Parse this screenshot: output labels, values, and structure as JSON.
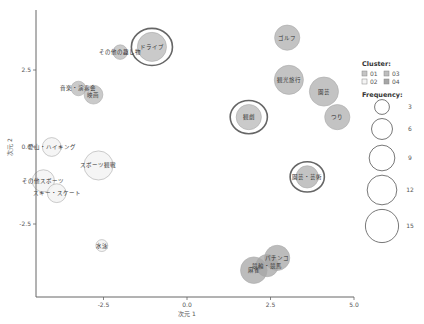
{
  "chart_data": {
    "type": "scatter",
    "subtype": "bubble",
    "title": "",
    "xlabel": "次元 1",
    "ylabel": "次元 2",
    "xlim": [
      -4.5,
      5.0
    ],
    "ylim": [
      -4.7,
      3.8
    ],
    "xticks": [
      -2.5,
      0.0,
      2.5,
      5.0
    ],
    "yticks": [
      -2.5,
      0.0,
      2.5
    ],
    "xtick_labels": [
      "-2.5",
      "0.0",
      "2.5",
      "5.0"
    ],
    "ytick_labels": [
      "-2.5",
      "0.0",
      "2.5"
    ],
    "grid": false,
    "legend_position": "right",
    "cluster_colors": {
      "01": "#c4c4c4",
      "02": "#f4f4f4",
      "03": "#bdbdbd",
      "04": "#a6a6a6"
    },
    "points": [
      {
        "label": "ドライブ",
        "x": -1.05,
        "y": 3.25,
        "frequency": 12,
        "cluster": "01",
        "highlighted": true
      },
      {
        "label": "その他の趣し物",
        "x": -2.0,
        "y": 3.08,
        "frequency": 3,
        "cluster": "01",
        "highlighted": false
      },
      {
        "label": "音楽・演奏会",
        "x": -3.25,
        "y": 1.9,
        "frequency": 3,
        "cluster": "01",
        "highlighted": false
      },
      {
        "label": "映画",
        "x": -2.8,
        "y": 1.7,
        "frequency": 5,
        "cluster": "01",
        "highlighted": false
      },
      {
        "label": "ゴルフ",
        "x": 3.0,
        "y": 3.55,
        "frequency": 9,
        "cluster": "03",
        "highlighted": false
      },
      {
        "label": "観光旅行",
        "x": 3.05,
        "y": 2.18,
        "frequency": 12,
        "cluster": "03",
        "highlighted": false
      },
      {
        "label": "園芸",
        "x": 4.1,
        "y": 1.8,
        "frequency": 12,
        "cluster": "03",
        "highlighted": false
      },
      {
        "label": "つり",
        "x": 4.5,
        "y": 0.97,
        "frequency": 9,
        "cluster": "03",
        "highlighted": false
      },
      {
        "label": "観劇",
        "x": 1.85,
        "y": 0.97,
        "frequency": 9,
        "cluster": "01",
        "highlighted": true
      },
      {
        "label": "園芸・芸術",
        "x": 3.6,
        "y": -0.97,
        "frequency": 7,
        "cluster": "03",
        "highlighted": true
      },
      {
        "label": "登山・ハイキング",
        "x": -4.05,
        "y": 0.0,
        "frequency": 5,
        "cluster": "02",
        "highlighted": false
      },
      {
        "label": "スポーツ観戦",
        "x": -2.65,
        "y": -0.6,
        "frequency": 12,
        "cluster": "02",
        "highlighted": false
      },
      {
        "label": "その他スポーツ",
        "x": -4.3,
        "y": -1.1,
        "frequency": 7,
        "cluster": "02",
        "highlighted": false
      },
      {
        "label": "スキー・スケート",
        "x": -3.9,
        "y": -1.5,
        "frequency": 5,
        "cluster": "02",
        "highlighted": false
      },
      {
        "label": "水泳",
        "x": -2.55,
        "y": -3.2,
        "frequency": 2,
        "cluster": "02",
        "highlighted": false
      },
      {
        "label": "パチンコ",
        "x": 2.7,
        "y": -3.6,
        "frequency": 9,
        "cluster": "04",
        "highlighted": false
      },
      {
        "label": "競輪・競馬",
        "x": 2.4,
        "y": -3.85,
        "frequency": 7,
        "cluster": "04",
        "highlighted": false
      },
      {
        "label": "麻雀",
        "x": 2.0,
        "y": -4.0,
        "frequency": 10,
        "cluster": "04",
        "highlighted": false
      }
    ],
    "legend": {
      "cluster_title": "Cluster:",
      "clusters": [
        "01",
        "02",
        "03",
        "04"
      ],
      "frequency_title": "Frequency:",
      "frequencies": [
        3,
        6,
        9,
        12,
        15
      ]
    }
  }
}
